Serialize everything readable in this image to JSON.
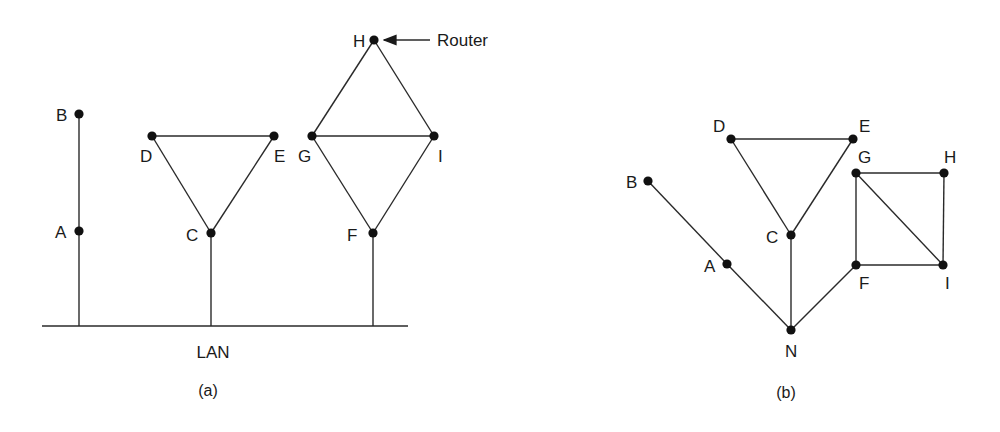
{
  "panels": [
    {
      "id": "a",
      "caption": "(a)",
      "caption_pos": [
        208,
        396
      ],
      "lan": {
        "label": "LAN",
        "label_pos": [
          213,
          358
        ],
        "line": [
          42,
          326,
          408,
          326
        ]
      },
      "nodes": [
        {
          "id": "B",
          "label": "B",
          "x": 79,
          "y": 114,
          "lx": 56,
          "ly": 121
        },
        {
          "id": "A",
          "label": "A",
          "x": 79,
          "y": 231,
          "lx": 55,
          "ly": 238
        },
        {
          "id": "D",
          "label": "D",
          "x": 152,
          "y": 136,
          "lx": 140,
          "ly": 162
        },
        {
          "id": "E",
          "label": "E",
          "x": 274,
          "y": 136,
          "lx": 274,
          "ly": 162
        },
        {
          "id": "C",
          "label": "C",
          "x": 211,
          "y": 233,
          "lx": 186,
          "ly": 241
        },
        {
          "id": "H",
          "label": "H",
          "x": 374,
          "y": 40,
          "lx": 353,
          "ly": 47
        },
        {
          "id": "G",
          "label": "G",
          "x": 312,
          "y": 136,
          "lx": 298,
          "ly": 162
        },
        {
          "id": "I",
          "label": "I",
          "x": 434,
          "y": 136,
          "lx": 438,
          "ly": 162
        },
        {
          "id": "F",
          "label": "F",
          "x": 373,
          "y": 233,
          "lx": 347,
          "ly": 241
        }
      ],
      "edges": [
        [
          "B",
          "A"
        ],
        [
          "D",
          "E"
        ],
        [
          "D",
          "C"
        ],
        [
          "E",
          "C"
        ],
        [
          "H",
          "G"
        ],
        [
          "H",
          "I"
        ],
        [
          "G",
          "I"
        ],
        [
          "G",
          "F"
        ],
        [
          "I",
          "F"
        ]
      ],
      "lan_drops": [
        {
          "from": "A",
          "to_y": 326
        },
        {
          "from": "C",
          "to_y": 326
        },
        {
          "from": "F",
          "to_y": 326
        }
      ],
      "annotation": {
        "label": "Router",
        "target": "H",
        "arrow": [
          430,
          40,
          384,
          40
        ],
        "text_pos": [
          437,
          46
        ]
      }
    },
    {
      "id": "b",
      "caption": "(b)",
      "caption_pos": [
        786,
        398
      ],
      "nodes": [
        {
          "id": "D",
          "label": "D",
          "x": 731,
          "y": 139,
          "lx": 713,
          "ly": 132
        },
        {
          "id": "E",
          "label": "E",
          "x": 853,
          "y": 139,
          "lx": 859,
          "ly": 132
        },
        {
          "id": "C",
          "label": "C",
          "x": 791,
          "y": 235,
          "lx": 766,
          "ly": 243
        },
        {
          "id": "B",
          "label": "B",
          "x": 648,
          "y": 181,
          "lx": 626,
          "ly": 188
        },
        {
          "id": "A",
          "label": "A",
          "x": 727,
          "y": 264,
          "lx": 704,
          "ly": 272
        },
        {
          "id": "N",
          "label": "N",
          "x": 791,
          "y": 330,
          "lx": 785,
          "ly": 357
        },
        {
          "id": "G",
          "label": "G",
          "x": 856,
          "y": 173,
          "lx": 858,
          "ly": 163
        },
        {
          "id": "H",
          "label": "H",
          "x": 944,
          "y": 173,
          "lx": 944,
          "ly": 163
        },
        {
          "id": "F",
          "label": "F",
          "x": 856,
          "y": 265,
          "lx": 859,
          "ly": 289
        },
        {
          "id": "I",
          "label": "I",
          "x": 943,
          "y": 265,
          "lx": 945,
          "ly": 289
        }
      ],
      "edges": [
        [
          "D",
          "E"
        ],
        [
          "D",
          "C"
        ],
        [
          "E",
          "C"
        ],
        [
          "B",
          "A"
        ],
        [
          "A",
          "N"
        ],
        [
          "C",
          "N"
        ],
        [
          "F",
          "N"
        ],
        [
          "G",
          "H"
        ],
        [
          "H",
          "I"
        ],
        [
          "G",
          "F"
        ],
        [
          "F",
          "I"
        ],
        [
          "G",
          "I"
        ]
      ]
    }
  ]
}
